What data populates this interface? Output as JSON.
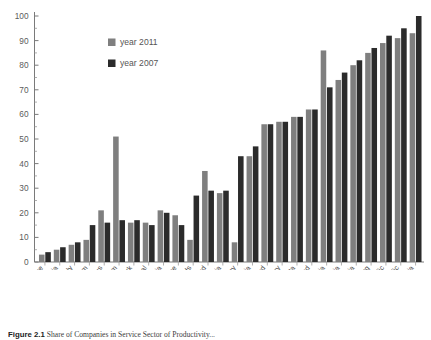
{
  "chart_data": {
    "type": "bar",
    "title": "",
    "xlabel": "",
    "ylabel": "",
    "ylim": [
      0,
      100
    ],
    "ytick_values": [
      0,
      10,
      20,
      30,
      40,
      50,
      60,
      70,
      80,
      90,
      100
    ],
    "ytick_labels": [
      "0",
      "10",
      "20",
      "30",
      "40",
      "50",
      "60",
      "70",
      "80",
      "90",
      "100"
    ],
    "grid": false,
    "legend_position": "upper-left-inside",
    "categories": [
      "France",
      "Estonia",
      "Italy",
      "United Kingdom",
      "Cyprus",
      "Belgium",
      "Denmark",
      "Portugal",
      "Slovenia",
      "Greece",
      "Netherlands",
      "Ireland",
      "Austria",
      "Germany",
      "Latvia",
      "Finland",
      "Hungary",
      "Malta",
      "Poland",
      "Lithuania",
      "Bulgaria",
      "Romania",
      "Luxembourg",
      "Slovak Republic",
      "Czech Republic",
      "Estonia"
    ],
    "series": [
      {
        "name": "year 2011",
        "color": "#7f7f7f",
        "values": [
          3,
          5,
          7,
          9,
          21,
          51,
          16,
          16,
          21,
          19,
          9,
          37,
          28,
          8,
          43,
          56,
          57,
          59,
          62,
          86,
          74,
          80,
          85,
          89,
          91,
          93
        ]
      },
      {
        "name": "year 2007",
        "color": "#2b2b2b",
        "values": [
          4,
          6,
          8,
          15,
          16,
          17,
          17,
          15,
          20,
          15,
          27,
          29,
          29,
          43,
          47,
          56,
          57,
          59,
          62,
          71,
          77,
          82,
          87,
          92,
          95,
          100
        ]
      }
    ],
    "legend": [
      "year 2011",
      "year 2007"
    ]
  },
  "legend": {
    "items": [
      {
        "label": "year 2011",
        "color": "#7f7f7f"
      },
      {
        "label": "year 2007",
        "color": "#2b2b2b"
      }
    ]
  },
  "caption": {
    "number": "Figure 2.1",
    "text": "Share of Companies in Service Sector of Productivity..."
  }
}
